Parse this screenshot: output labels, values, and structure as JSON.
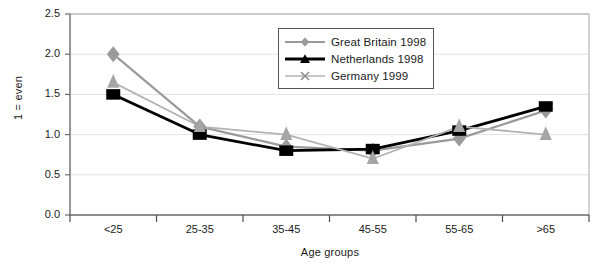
{
  "chart_data": {
    "type": "line",
    "title": "",
    "xlabel": "Age groups",
    "ylabel": "1 = even",
    "categories": [
      "<25",
      "25-35",
      "35-45",
      "45-55",
      "55-65",
      ">65"
    ],
    "ylim": [
      0.0,
      2.5
    ],
    "ytick_labels": [
      "0.0",
      "0.5",
      "1.0",
      "1.5",
      "2.0",
      "2.5"
    ],
    "ytick_values": [
      0.0,
      0.5,
      1.0,
      1.5,
      2.0,
      2.5
    ],
    "grid": true,
    "legend_position": "top-center",
    "series": [
      {
        "name": "Great Britain 1998",
        "marker": "diamond",
        "color": "#9a9a9a",
        "values": [
          2.0,
          1.1,
          0.85,
          0.8,
          0.95,
          1.3
        ]
      },
      {
        "name": "Netherlands 1998",
        "marker": "triangle",
        "color": "#000000",
        "values": [
          1.5,
          1.0,
          0.8,
          0.82,
          1.05,
          1.35
        ]
      },
      {
        "name": "Germany 1999",
        "marker": "x",
        "color": "#b3b3b3",
        "values": [
          1.65,
          1.1,
          1.0,
          0.7,
          1.1,
          1.0
        ]
      }
    ]
  },
  "axes": {
    "y_title": "1 = even",
    "x_title": "Age groups"
  },
  "legend": {
    "entries": [
      {
        "label": "Great Britain 1998"
      },
      {
        "label": "Netherlands 1998"
      },
      {
        "label": "Germany 1999"
      }
    ]
  }
}
